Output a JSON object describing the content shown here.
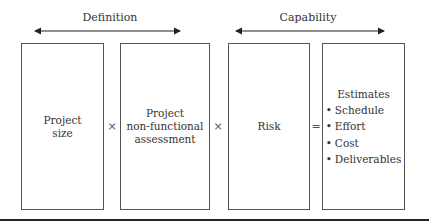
{
  "groups": [
    {
      "label": "Definition"
    },
    {
      "label": "Capability"
    }
  ],
  "boxes": [
    {
      "lines": [
        "Project",
        "size"
      ]
    },
    {
      "lines": [
        "Project",
        "non-functional",
        "assessment"
      ]
    },
    {
      "lines": [
        "Risk"
      ]
    },
    {
      "title": "Estimates",
      "items": [
        "Schedule",
        "Effort",
        "Cost",
        "Deliverables"
      ]
    }
  ],
  "operators": [
    "×",
    "×",
    "="
  ]
}
